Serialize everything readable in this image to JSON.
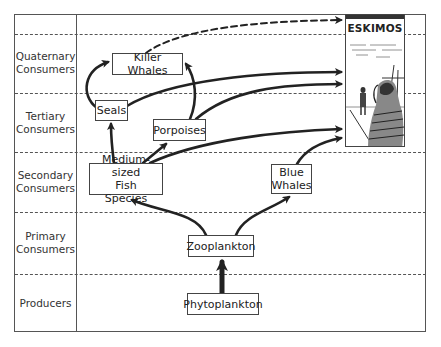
{
  "diagram": {
    "levels": [
      {
        "id": "quaternary",
        "label_line1": "Quaternary",
        "label_line2": "Consumers"
      },
      {
        "id": "tertiary",
        "label_line1": "Tertiary",
        "label_line2": "Consumers"
      },
      {
        "id": "secondary",
        "label_line1": "Secondary",
        "label_line2": "Consumers"
      },
      {
        "id": "primary",
        "label_line1": "Primary",
        "label_line2": "Consumers"
      },
      {
        "id": "producers",
        "label_line1": "Producers",
        "label_line2": ""
      }
    ],
    "nodes": {
      "eskimos": "ESKIMOS",
      "killer_whales": "Killer Whales",
      "seals": "Seals",
      "porpoises": "Porpoises",
      "fish_line1": "Medium-sized",
      "fish_line2": "Fish Species",
      "blue_whales_line1": "Blue",
      "blue_whales_line2": "Whales",
      "zooplankton": "Zooplankton",
      "phytoplankton": "Phytoplankton"
    },
    "edges": [
      {
        "from": "Phytoplankton",
        "to": "Zooplankton",
        "style": "thick"
      },
      {
        "from": "Zooplankton",
        "to": "Medium-sized Fish Species",
        "style": "solid"
      },
      {
        "from": "Zooplankton",
        "to": "Blue Whales",
        "style": "solid"
      },
      {
        "from": "Medium-sized Fish Species",
        "to": "Seals",
        "style": "solid"
      },
      {
        "from": "Medium-sized Fish Species",
        "to": "Porpoises",
        "style": "solid"
      },
      {
        "from": "Medium-sized Fish Species",
        "to": "Eskimos",
        "style": "solid"
      },
      {
        "from": "Blue Whales",
        "to": "Eskimos",
        "style": "solid"
      },
      {
        "from": "Seals",
        "to": "Killer Whales",
        "style": "solid"
      },
      {
        "from": "Seals",
        "to": "Eskimos",
        "style": "solid"
      },
      {
        "from": "Porpoises",
        "to": "Killer Whales",
        "style": "solid"
      },
      {
        "from": "Porpoises",
        "to": "Eskimos",
        "style": "solid"
      },
      {
        "from": "Killer Whales",
        "to": "Eskimos",
        "style": "dashed"
      }
    ],
    "colors": {
      "line": "#222222",
      "frame": "#555555",
      "background": "#ffffff"
    }
  }
}
